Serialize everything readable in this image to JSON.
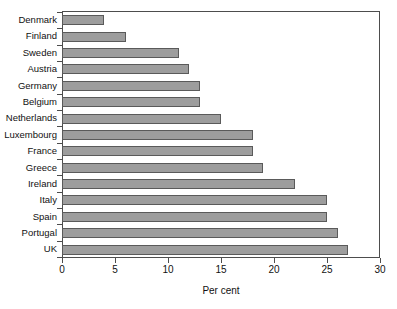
{
  "chart_data": {
    "type": "bar",
    "orientation": "horizontal",
    "title": "",
    "xlabel": "Per cent",
    "ylabel": "",
    "xlim": [
      0,
      30
    ],
    "xticks": [
      0,
      5,
      10,
      15,
      20,
      25,
      30
    ],
    "grid": false,
    "legend": null,
    "bar_color": "#9d9d9d",
    "bar_edge_color": "#5a5a5a",
    "categories": [
      "Denmark",
      "Finland",
      "Sweden",
      "Austria",
      "Germany",
      "Belgium",
      "Netherlands",
      "Luxembourg",
      "France",
      "Greece",
      "Ireland",
      "Italy",
      "Spain",
      "Portugal",
      "UK"
    ],
    "values": [
      4,
      6,
      11,
      12,
      13,
      13,
      15,
      18,
      18,
      19,
      22,
      25,
      25,
      26,
      27
    ]
  }
}
